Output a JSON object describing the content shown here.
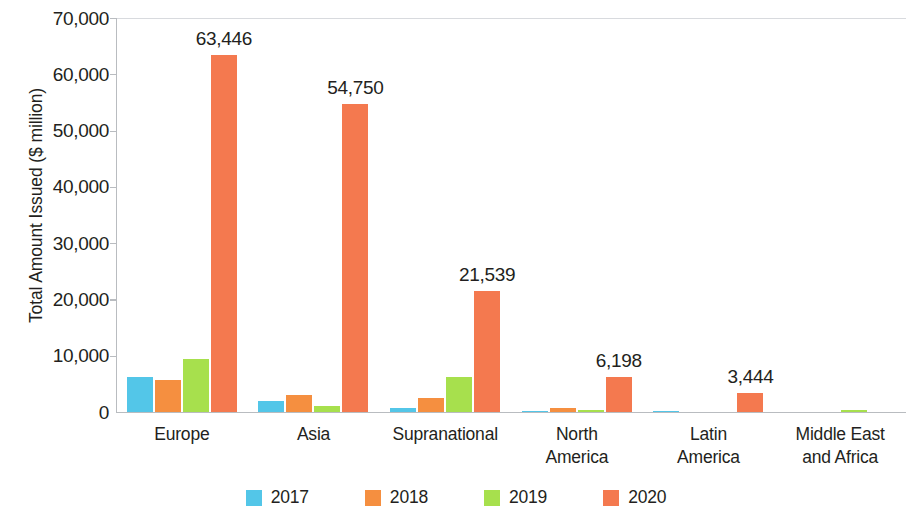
{
  "chart_data": {
    "type": "bar",
    "title": "",
    "xlabel": "",
    "ylabel": "Total Amount Issued ($ million)",
    "ylim": [
      0,
      70000
    ],
    "ytick_values": [
      0,
      10000,
      20000,
      30000,
      40000,
      50000,
      60000,
      70000
    ],
    "ytick_labels": [
      "0",
      "10,000",
      "20,000",
      "30,000",
      "40,000",
      "50,000",
      "60,000",
      "70,000"
    ],
    "grid": false,
    "legend_position": "bottom",
    "categories": [
      "Europe",
      "Asia",
      "Supranational",
      "North America",
      "Latin America",
      "Middle East and Africa"
    ],
    "category_label_lines": [
      [
        "Europe"
      ],
      [
        "Asia"
      ],
      [
        "Supranational"
      ],
      [
        "North",
        "America"
      ],
      [
        "Latin",
        "America"
      ],
      [
        "Middle East",
        "and Africa"
      ]
    ],
    "series": [
      {
        "name": "2017",
        "color": "#53c6e8",
        "values": [
          6200,
          2000,
          750,
          120,
          180,
          0
        ]
      },
      {
        "name": "2018",
        "color": "#f58f40",
        "values": [
          5700,
          3100,
          2450,
          680,
          0,
          0
        ]
      },
      {
        "name": "2019",
        "color": "#a7e04d",
        "values": [
          9400,
          1150,
          6200,
          400,
          0,
          330
        ]
      },
      {
        "name": "2020",
        "color": "#f4794f",
        "values": [
          63446,
          54750,
          21539,
          6198,
          3444,
          0
        ]
      }
    ],
    "data_labels": {
      "2020": [
        "63,446",
        "54,750",
        "21,539",
        "6,198",
        "3,444",
        ""
      ]
    }
  },
  "legend": {
    "items": [
      {
        "label": "2017",
        "color": "#53c6e8"
      },
      {
        "label": "2018",
        "color": "#f58f40"
      },
      {
        "label": "2019",
        "color": "#a7e04d"
      },
      {
        "label": "2020",
        "color": "#f4794f"
      }
    ]
  }
}
